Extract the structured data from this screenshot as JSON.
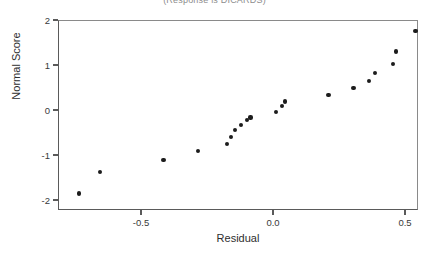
{
  "chart_data": {
    "type": "scatter",
    "title": "(Response is DICARDS)",
    "xlabel": "Residual",
    "ylabel": "Normal Score",
    "xlim": [
      -0.78,
      0.61
    ],
    "ylim": [
      -2.12,
      2.05
    ],
    "xticks": [
      -0.5,
      0.0,
      0.5
    ],
    "xticklabels": [
      "-0.5",
      "0.0",
      "0.5"
    ],
    "yticks": [
      2,
      1,
      0,
      -1,
      -2
    ],
    "yticklabels": [
      "2",
      "1",
      "0",
      "-1",
      "-2"
    ],
    "grid": false,
    "legend": null,
    "marker_color": "#1c1c1c",
    "axis_color": "#5a5a5a",
    "x": [
      -0.735,
      -0.655,
      -0.415,
      -0.285,
      -0.175,
      -0.16,
      -0.145,
      -0.12,
      -0.1,
      -0.085,
      0.01,
      0.035,
      0.045,
      0.21,
      0.305,
      0.365,
      0.385,
      0.455,
      0.465,
      0.54
    ],
    "y": [
      -1.855,
      -1.385,
      -1.12,
      -0.91,
      -0.75,
      -0.595,
      -0.45,
      -0.33,
      -0.215,
      -0.165,
      -0.045,
      0.085,
      0.19,
      0.34,
      0.485,
      0.645,
      0.815,
      1.03,
      1.3,
      1.76
    ],
    "n_points": 20
  },
  "axes": {
    "x_tick_px": [
      141,
      273,
      405
    ],
    "y_tick_px": [
      20,
      65,
      110,
      154,
      199
    ]
  }
}
